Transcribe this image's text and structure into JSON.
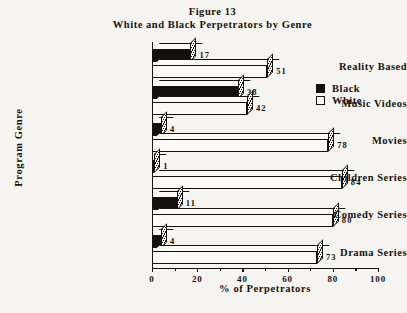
{
  "title": {
    "line1": "Figure 13",
    "line2": "White and Black Perpetrators by Genre"
  },
  "legend": {
    "position": "top-right",
    "entries": [
      {
        "label": "Black",
        "swatch": "black-swatch",
        "color": "#121110"
      },
      {
        "label": "White",
        "swatch": "white-swatch",
        "color": "#FFFFFF"
      }
    ]
  },
  "axes": {
    "xlabel": "% of Perpetrators",
    "ylabel": "Program Genre",
    "xticks": [
      "0",
      "20",
      "40",
      "60",
      "80",
      "100"
    ]
  },
  "chart_data": {
    "type": "bar",
    "orientation": "horizontal",
    "style": "3d",
    "xlabel": "% of Perpetrators",
    "ylabel": "Program Genre",
    "xlim": [
      0,
      100
    ],
    "xticks": [
      0,
      20,
      40,
      60,
      80,
      100
    ],
    "minor_tick_step": 10,
    "grid": false,
    "legend_position": "top-right",
    "categories": [
      "Reality Based",
      "Music Videos",
      "Movies",
      "Children Series",
      "Comedy Series",
      "Drama Series"
    ],
    "series": [
      {
        "name": "Black",
        "color": "#121110",
        "values": [
          17,
          38,
          4,
          1,
          11,
          4
        ]
      },
      {
        "name": "White",
        "color": "#FFFFFF",
        "values": [
          51,
          42,
          78,
          84,
          80,
          73
        ]
      }
    ]
  }
}
